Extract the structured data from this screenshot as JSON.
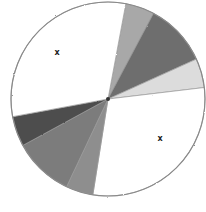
{
  "chart_data": {
    "type": "pie",
    "title": "",
    "style": "hand-drawn pencil sketch, grayscale shading",
    "center": [
      108,
      99
    ],
    "radius": 97,
    "start_angle_deg": -79.4,
    "slices": [
      {
        "label": "",
        "percent": 4.8,
        "degrees": 17.4,
        "color": "#a8a8a8"
      },
      {
        "label": "",
        "percent": 10.5,
        "degrees": 37.7,
        "color": "#6e6e6e"
      },
      {
        "label": "",
        "percent": 4.9,
        "degrees": 17.5,
        "color": "#dcdcdc"
      },
      {
        "label": "",
        "percent": 29.4,
        "degrees": 105.8,
        "color": "#ffffff",
        "marker": "x"
      },
      {
        "label": "",
        "percent": 4.5,
        "degrees": 16.3,
        "color": "#8e8e8e"
      },
      {
        "label": "",
        "percent": 10.0,
        "degrees": 36.1,
        "color": "#7c7c7c"
      },
      {
        "label": "",
        "percent": 5.0,
        "degrees": 18.1,
        "color": "#4e4e4e"
      },
      {
        "label": "",
        "percent": 30.9,
        "degrees": 111.1,
        "color": "#ffffff",
        "marker": "x"
      }
    ],
    "markers": [
      {
        "text": "x",
        "x": 57,
        "y": 53
      },
      {
        "text": "x",
        "x": 160,
        "y": 139
      }
    ],
    "legend": null
  }
}
